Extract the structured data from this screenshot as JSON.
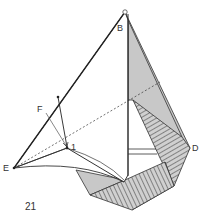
{
  "diagram": {
    "step_number": "21",
    "labels": {
      "B": "B",
      "D": "D",
      "E": "E",
      "F": "F",
      "point_1": "1"
    },
    "colors": {
      "line": "#333333",
      "shade": "#c8c8c8",
      "paper": "#ffffff"
    }
  }
}
